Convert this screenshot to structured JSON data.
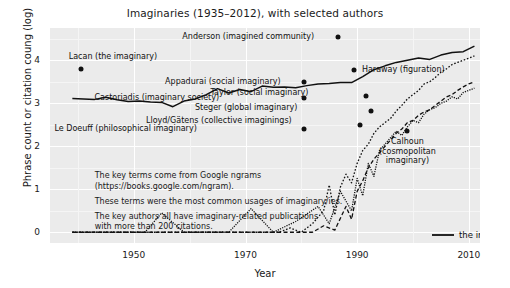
{
  "chart_data": {
    "type": "line",
    "title": "Imaginaries (1935–2012), with selected authors",
    "xlabel": "Year",
    "ylabel": "Phrase count or citation coung (log)",
    "xlim": [
      1935,
      2012
    ],
    "ylim": [
      -0.25,
      4.75
    ],
    "xticks": [
      "1950",
      "1970",
      "1990",
      "2010"
    ],
    "xtick_values": [
      1950,
      1970,
      1990,
      2010
    ],
    "yticks": [
      "0",
      "1",
      "2",
      "3",
      "4"
    ],
    "ytick_values": [
      0,
      1,
      2,
      3,
      4
    ],
    "grid": true,
    "legend_position": "bottom-right",
    "series": [
      {
        "name": "the imaginary",
        "style": "solid",
        "x": [
          1939,
          1941,
          1943,
          1945,
          1947,
          1949,
          1951,
          1953,
          1955,
          1957,
          1959,
          1961,
          1963,
          1965,
          1967,
          1969,
          1971,
          1973,
          1975,
          1977,
          1979,
          1981,
          1983,
          1985,
          1987,
          1989,
          1991,
          1993,
          1995,
          1997,
          1999,
          2001,
          2003,
          2005,
          2007,
          2009,
          2011
        ],
        "values": [
          3.11,
          3.1,
          3.09,
          3.14,
          3.08,
          3.04,
          3.05,
          3.03,
          3.02,
          2.92,
          3.05,
          3.1,
          3.2,
          3.34,
          3.24,
          3.32,
          3.27,
          3.4,
          3.37,
          3.38,
          3.36,
          3.41,
          3.45,
          3.46,
          3.48,
          3.48,
          3.62,
          3.78,
          3.87,
          3.95,
          4.0,
          4.05,
          4.02,
          4.12,
          4.18,
          4.2,
          4.33
        ]
      },
      {
        "name": "social imaginary",
        "style": "dotted",
        "x": [
          1939,
          1950,
          1954,
          1958,
          1962,
          1966,
          1970,
          1974,
          1976,
          1978,
          1980,
          1982,
          1984,
          1985,
          1986,
          1987,
          1988,
          1989,
          1990,
          1991,
          1992,
          1993,
          1994,
          1995,
          1996,
          1997,
          1998,
          1999,
          2000,
          2001,
          2002,
          2003,
          2004,
          2005,
          2006,
          2007,
          2008,
          2009,
          2010,
          2011
        ],
        "values": [
          0,
          0,
          0,
          0,
          0,
          0,
          0,
          0,
          0,
          0.1,
          0,
          0.2,
          0.5,
          1.1,
          0.4,
          1.05,
          1.35,
          1.15,
          1.6,
          1.9,
          2.05,
          2.3,
          2.45,
          2.55,
          2.65,
          2.82,
          2.95,
          3.1,
          3.2,
          3.3,
          3.45,
          3.5,
          3.6,
          3.72,
          3.8,
          3.9,
          3.95,
          4.0,
          4.05,
          4.1
        ]
      },
      {
        "name": "cultural imaginary",
        "style": "dashed",
        "x": [
          1939,
          1956,
          1960,
          1964,
          1968,
          1972,
          1976,
          1980,
          1982,
          1984,
          1986,
          1988,
          1989,
          1990,
          1991,
          1992,
          1993,
          1994,
          1995,
          1996,
          1997,
          1998,
          1999,
          2000,
          2001,
          2002,
          2003,
          2004,
          2005,
          2006,
          2007,
          2008,
          2009,
          2010,
          2011
        ],
        "values": [
          0,
          0,
          0,
          0,
          0,
          0,
          0,
          0,
          0,
          0.15,
          0.05,
          0.6,
          0.3,
          0.95,
          1.2,
          1.5,
          1.7,
          1.85,
          2.0,
          2.15,
          2.3,
          2.4,
          2.55,
          2.6,
          2.72,
          2.8,
          2.85,
          2.95,
          3.05,
          3.15,
          3.2,
          3.3,
          3.38,
          3.45,
          3.5
        ]
      },
      {
        "name": "national imaginary",
        "style": "densely-dotted",
        "x": [
          1939,
          1952,
          1955,
          1959,
          1963,
          1967,
          1971,
          1975,
          1979,
          1983,
          1985,
          1987,
          1989,
          1990,
          1991,
          1992,
          1993,
          1994,
          1995,
          1996,
          1997,
          1998,
          1999,
          2000,
          2001,
          2002,
          2003,
          2004,
          2005,
          2006,
          2007,
          2008,
          2009,
          2010,
          2011
        ],
        "values": [
          0,
          0,
          0.45,
          0,
          0,
          0,
          0.55,
          0,
          0.25,
          0.6,
          0.2,
          0.95,
          0.5,
          1.25,
          0.85,
          1.6,
          1.3,
          1.9,
          2.05,
          2.2,
          2.35,
          2.25,
          2.45,
          2.6,
          2.55,
          2.75,
          2.85,
          2.9,
          3.0,
          3.05,
          3.15,
          3.1,
          3.25,
          3.3,
          3.35
        ]
      }
    ],
    "annotations": [
      {
        "label": "Anderson (imagined community)",
        "x": 1983,
        "y": 4.55,
        "dot_x": 1986.5,
        "dot_y": 4.55,
        "align": "right"
      },
      {
        "label": "Lacan (the imaginary)",
        "x": 1938,
        "y": 4.08,
        "dot_x": 1940.5,
        "dot_y": 3.8,
        "align": "left"
      },
      {
        "label": "Haraway (figuration)",
        "x": 1990.5,
        "y": 3.78,
        "dot_x": 1989.5,
        "dot_y": 3.78,
        "align": "left"
      },
      {
        "label": "Appadurai (social imaginary)",
        "x": 1977,
        "y": 3.5,
        "dot_x": 1980.5,
        "dot_y": 3.5,
        "align": "right"
      },
      {
        "label": "Taylor (social imaginary)",
        "x": 1982,
        "y": 3.25,
        "dot_x": 1991.5,
        "dot_y": 3.17,
        "align": "right"
      },
      {
        "label": "Castoriadis (imaginary society)",
        "x": 1966,
        "y": 3.12,
        "dot_x": 1980.5,
        "dot_y": 3.12,
        "align": "right"
      },
      {
        "label": "Steger (global imaginary)",
        "x": 1980,
        "y": 2.9,
        "dot_x": 1992.5,
        "dot_y": 2.82,
        "align": "right"
      },
      {
        "label": "Lloyd/Gätens (collective imaginings)",
        "x": 1979,
        "y": 2.58,
        "dot_x": 1990.5,
        "dot_y": 2.5,
        "align": "right"
      },
      {
        "label": "Le Doeuff (philosophical imaginary)",
        "x": 1962,
        "y": 2.4,
        "dot_x": 1980.5,
        "dot_y": 2.4,
        "align": "right"
      },
      {
        "label": "Calhoun\n(cosmopolitan\nimaginary)",
        "x": 1999,
        "y": 2.1,
        "dot_x": 1999,
        "dot_y": 2.35,
        "align": "center",
        "multiline": true
      }
    ],
    "notes": [
      "The key terms come from Google ngrams",
      "(https://books.google.com/ngram).",
      "These terms were the most common usages of imaginary/ies.",
      "The key authors all have imaginary-related publications",
      "with more than 200 citations."
    ],
    "colors": {
      "plot_background": "#ebebeb",
      "gridline": "#ffffff",
      "line": "#111111",
      "text": "#1a1a1a",
      "figure_background": "#ffffff"
    }
  }
}
